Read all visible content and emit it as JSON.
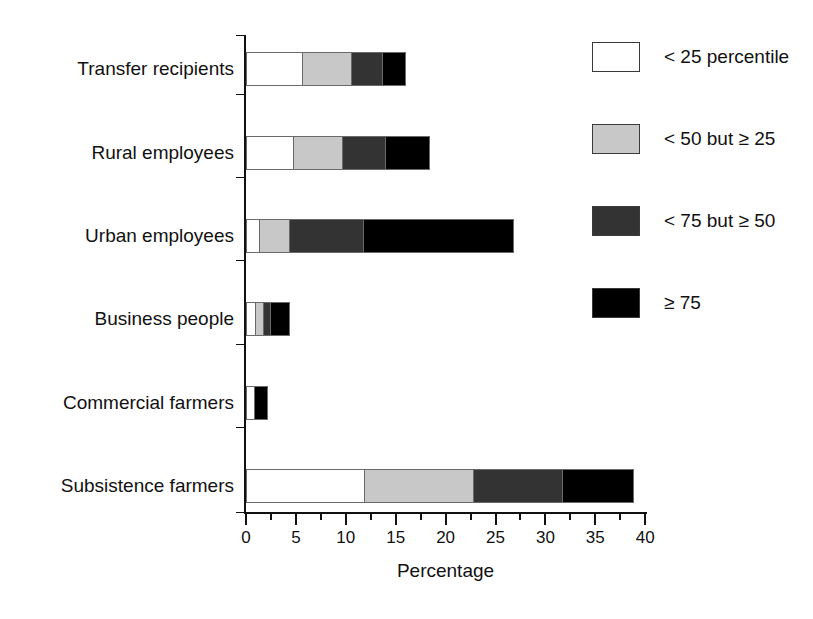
{
  "chart_data": {
    "type": "bar",
    "orientation": "horizontal",
    "stacked": true,
    "title": "",
    "xlabel": "Percentage",
    "ylabel": "",
    "xlim": [
      0,
      40
    ],
    "xticks": [
      0,
      5,
      10,
      15,
      20,
      25,
      30,
      35,
      40
    ],
    "xtick_labels": [
      "0",
      "5",
      "10",
      "15",
      "20",
      "25",
      "30",
      "35",
      "40"
    ],
    "minor_tick_interval": 2.5,
    "grid": false,
    "legend_position": "right",
    "categories": [
      "Transfer recipients",
      "Rural employees",
      "Urban employees",
      "Business people",
      "Commercial farmers",
      "Subsistence farmers"
    ],
    "series": [
      {
        "name": "< 25 percentile",
        "color": "#ffffff",
        "values": [
          5.6,
          4.7,
          1.3,
          0.9,
          0.8,
          11.8
        ]
      },
      {
        "name": "< 50 but ≥ 25",
        "color": "#c8c8c8",
        "values": [
          4.9,
          4.9,
          3.0,
          0.8,
          0.0,
          10.9
        ]
      },
      {
        "name": "< 75 but ≥ 50",
        "color": "#333333",
        "values": [
          3.1,
          4.3,
          7.4,
          0.7,
          0.0,
          9.0
        ]
      },
      {
        "name": "≥ 75",
        "color": "#000000",
        "values": [
          2.4,
          4.5,
          15.2,
          2.0,
          1.4,
          7.2
        ]
      }
    ],
    "totals": [
      16.0,
      18.4,
      26.9,
      4.4,
      2.2,
      38.9
    ]
  },
  "axis": {
    "x_title": "Percentage",
    "tick_labels": [
      "0",
      "5",
      "10",
      "15",
      "20",
      "25",
      "30",
      "35",
      "40"
    ]
  },
  "legend": {
    "items": [
      {
        "label": "< 25 percentile",
        "color": "#ffffff"
      },
      {
        "label": "< 50 but ≥ 25",
        "color": "#c8c8c8"
      },
      {
        "label": "< 75 but ≥ 50",
        "color": "#333333"
      },
      {
        "label": "≥ 75",
        "color": "#000000"
      }
    ]
  }
}
